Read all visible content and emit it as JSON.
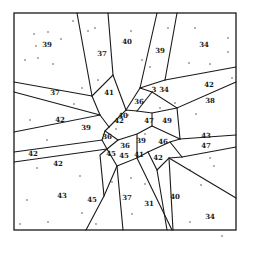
{
  "diagram": {
    "type": "voronoi-tessellation",
    "frame": {
      "x": 14,
      "y": 13,
      "w": 222,
      "h": 217
    },
    "cell_labels": [
      {
        "text": "39",
        "x": 47,
        "y": 47
      },
      {
        "text": "37",
        "x": 102,
        "y": 56
      },
      {
        "text": "40",
        "x": 127,
        "y": 44
      },
      {
        "text": "39",
        "x": 160,
        "y": 53
      },
      {
        "text": "34",
        "x": 204,
        "y": 47
      },
      {
        "text": "37",
        "x": 55,
        "y": 95
      },
      {
        "text": "41",
        "x": 109,
        "y": 95
      },
      {
        "text": "3",
        "x": 154,
        "y": 92
      },
      {
        "text": "34",
        "x": 164,
        "y": 92
      },
      {
        "text": "42",
        "x": 209,
        "y": 87
      },
      {
        "text": "42",
        "x": 60,
        "y": 122
      },
      {
        "text": "36",
        "x": 139,
        "y": 104
      },
      {
        "text": "38",
        "x": 210,
        "y": 103
      },
      {
        "text": "40",
        "x": 123,
        "y": 118
      },
      {
        "text": "42",
        "x": 119,
        "y": 123
      },
      {
        "text": "39",
        "x": 86,
        "y": 130
      },
      {
        "text": "47",
        "x": 149,
        "y": 123
      },
      {
        "text": "49",
        "x": 167,
        "y": 123
      },
      {
        "text": "36",
        "x": 107,
        "y": 139
      },
      {
        "text": "36",
        "x": 125,
        "y": 148
      },
      {
        "text": "39",
        "x": 141,
        "y": 143
      },
      {
        "text": "46",
        "x": 163,
        "y": 144
      },
      {
        "text": "43",
        "x": 206,
        "y": 138
      },
      {
        "text": "47",
        "x": 206,
        "y": 148
      },
      {
        "text": "42",
        "x": 33,
        "y": 156
      },
      {
        "text": "45",
        "x": 111,
        "y": 156
      },
      {
        "text": "45",
        "x": 124,
        "y": 158
      },
      {
        "text": "41",
        "x": 139,
        "y": 157
      },
      {
        "text": "42",
        "x": 158,
        "y": 160
      },
      {
        "text": "42",
        "x": 58,
        "y": 166
      },
      {
        "text": "43",
        "x": 62,
        "y": 198
      },
      {
        "text": "45",
        "x": 92,
        "y": 202
      },
      {
        "text": "37",
        "x": 127,
        "y": 200
      },
      {
        "text": "31",
        "x": 149,
        "y": 206
      },
      {
        "text": "40",
        "x": 175,
        "y": 199
      },
      {
        "text": "34",
        "x": 210,
        "y": 219
      }
    ]
  }
}
